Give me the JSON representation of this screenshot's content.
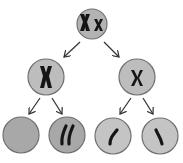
{
  "caption": "(cropped caption text)",
  "diagram": {
    "cells": [
      {
        "id": "parent",
        "label": "Xx",
        "fill": "#b3b3b3"
      },
      {
        "id": "meiosis1-left",
        "chromosome": "X",
        "fill": "#bdbdbd"
      },
      {
        "id": "meiosis1-right",
        "chromosome": "x",
        "fill": "#bdbdbd"
      },
      {
        "id": "gamete-1",
        "chromosome": "none",
        "fill": "#a8a8a8"
      },
      {
        "id": "gamete-2",
        "chromosome": "two chromatids",
        "fill": "#a8a8a8"
      },
      {
        "id": "gamete-3",
        "chromosome": "one chromatid",
        "fill": "#c4c4c4"
      },
      {
        "id": "gamete-4",
        "chromosome": "one chromatid",
        "fill": "#c4c4c4"
      }
    ],
    "colors": {
      "outline": "#707070",
      "chromosome": "#151515",
      "arrow": "#333333"
    }
  }
}
